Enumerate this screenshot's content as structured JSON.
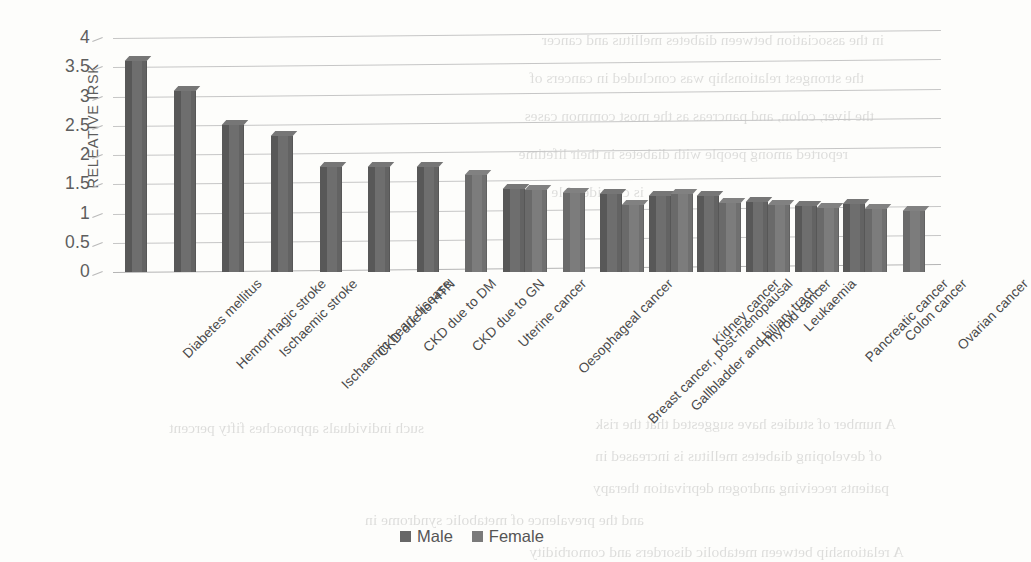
{
  "chart_data": {
    "type": "bar",
    "title": "",
    "xlabel": "",
    "ylabel": "RELEATIVE IRSK",
    "ylim": [
      0,
      4
    ],
    "ytick_values": [
      "4",
      "3.5",
      "3",
      "2.5",
      "2",
      "1.5",
      "1",
      "0.5",
      "0"
    ],
    "grid": true,
    "legend_position": "bottom",
    "categories": [
      "Diabetes mellitus",
      "Hemorrhagic stroke",
      "Ischaemic stroke",
      "Ischaemic heart disease",
      "CKD due to HTN",
      "CKD due to DM",
      "CKD due to GN",
      "Uterine cancer",
      "Oesophageal cancer",
      "Breast cancer, post-menopausal",
      "Gallbladder and biliary tract...",
      "Kidney cancer",
      "Thyroid cancer",
      "Leukaemia",
      "Pancreatic cancer",
      "Colon cancer",
      "Ovarian cancer"
    ],
    "series": [
      {
        "name": "Male",
        "values": [
          3.6,
          3.1,
          2.52,
          2.33,
          1.8,
          1.8,
          1.8,
          null,
          1.42,
          null,
          1.33,
          1.3,
          1.3,
          1.2,
          1.13,
          1.17,
          null
        ]
      },
      {
        "name": "Female",
        "values": [
          null,
          null,
          null,
          null,
          null,
          null,
          null,
          1.65,
          1.4,
          1.35,
          1.15,
          1.33,
          1.18,
          1.15,
          1.1,
          1.07,
          1.04
        ]
      }
    ],
    "colors": {
      "male": "#676767",
      "female": "#7a7a7a",
      "gridline": "#c6c6c6",
      "text": "#5a5a5a"
    }
  },
  "legend": {
    "items": [
      {
        "label": "Male",
        "swatch": "male"
      },
      {
        "label": "Female",
        "swatch": "female"
      }
    ]
  },
  "background_text": {
    "lines": [
      "in the association between diabetes mellitus and cancer",
      "the strongest relationship was concluded in cancers of",
      "the liver, colon, and pancreas as the most common cases",
      "reported among people with diabetes in their lifetime",
      "is considerable",
      "A number of studies have suggested that the risk",
      "of developing diabetes mellitus is increased in",
      "patients receiving androgen deprivation therapy",
      "and the prevalence of metabolic syndrome in",
      "such individuals approaches fifty percent",
      "A relationship between metabolic disorders and comorbidity"
    ]
  }
}
